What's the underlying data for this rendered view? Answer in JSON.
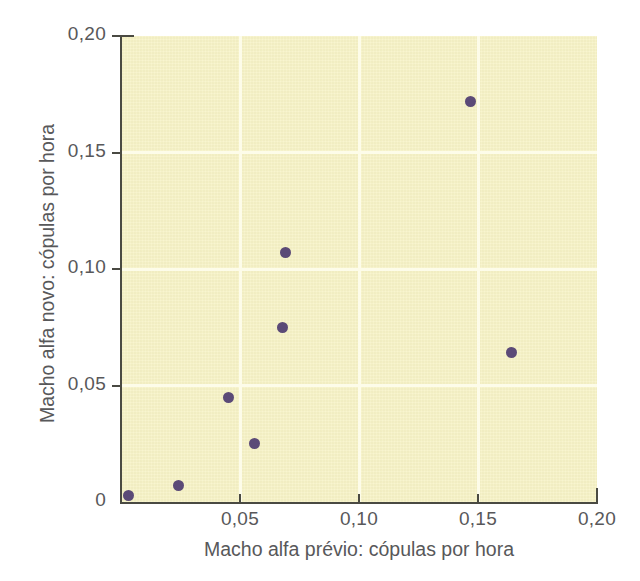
{
  "chart_data": {
    "type": "scatter",
    "title": "",
    "xlabel": "Macho alfa prévio: cópulas por hora",
    "ylabel": "Macho alfa novo: cópulas por hora",
    "xlim": [
      0,
      0.2
    ],
    "ylim": [
      0,
      0.2
    ],
    "grid": true,
    "legend": "none",
    "x_tick_labels": [
      "0,05",
      "0,10",
      "0,15",
      "0,20"
    ],
    "x_tick_values": [
      0.05,
      0.1,
      0.15,
      0.2
    ],
    "y_tick_labels": [
      "0",
      "0,05",
      "0,10",
      "0,15",
      "0,20"
    ],
    "y_tick_values": [
      0,
      0.05,
      0.1,
      0.15,
      0.2
    ],
    "series": [
      {
        "name": "pares de machos alfa",
        "marker": "circle",
        "color": "#5b4a77",
        "points": [
          {
            "x": 0.003,
            "y": 0.003
          },
          {
            "x": 0.024,
            "y": 0.007
          },
          {
            "x": 0.045,
            "y": 0.045
          },
          {
            "x": 0.056,
            "y": 0.025
          },
          {
            "x": 0.068,
            "y": 0.075
          },
          {
            "x": 0.069,
            "y": 0.107
          },
          {
            "x": 0.147,
            "y": 0.172
          },
          {
            "x": 0.164,
            "y": 0.064
          }
        ]
      }
    ]
  },
  "style": {
    "plot_background": "#f7f3c6",
    "gridline_color": "#fdfce9",
    "axis_color": "#4a4a42",
    "marker_color": "#5b4a77",
    "text_color": "#58585a",
    "page_background": "#ffffff"
  }
}
